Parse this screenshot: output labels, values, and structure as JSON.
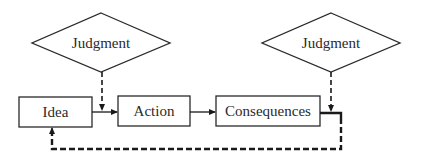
{
  "diagram": {
    "nodes": {
      "judgment_left": {
        "label": "Judgment",
        "shape": "diamond"
      },
      "judgment_right": {
        "label": "Judgment",
        "shape": "diamond"
      },
      "idea": {
        "label": "Idea",
        "shape": "rectangle"
      },
      "action": {
        "label": "Action",
        "shape": "rectangle"
      },
      "consequences": {
        "label": "Consequences",
        "shape": "rectangle"
      }
    },
    "edges": [
      {
        "from": "idea",
        "to": "action",
        "style": "solid"
      },
      {
        "from": "action",
        "to": "consequences",
        "style": "solid"
      },
      {
        "from": "judgment_left",
        "to": "idea-action edge",
        "style": "dashed"
      },
      {
        "from": "judgment_right",
        "to": "consequences output",
        "style": "dashed"
      },
      {
        "from": "consequences",
        "to": "idea",
        "style": "thick dashed",
        "type": "feedback loop"
      }
    ],
    "colors": {
      "stroke": "#1a1a1a",
      "text": "#2a2a2a",
      "background": "#ffffff"
    }
  }
}
